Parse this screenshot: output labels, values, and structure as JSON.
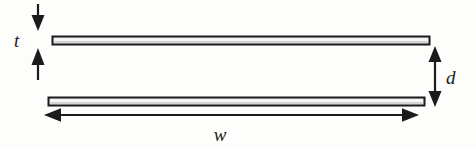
{
  "figure": {
    "kind": "parallel-plate-cross-section-diagram",
    "background_color": "#fdfdfc",
    "ink_color": "#1b1b1b",
    "plate_fill_color": "#e9e9e7",
    "plate_outline_color": "#1b1b1b",
    "width_px": 476,
    "height_px": 148
  },
  "labels": {
    "thickness": "t",
    "separation": "d",
    "width": "w"
  },
  "parts": {
    "top_plate": {
      "name": "top-plate",
      "x": 52,
      "y": 36,
      "width": 378,
      "height": 9
    },
    "bottom_plate": {
      "name": "bottom-plate",
      "x": 48,
      "y": 97,
      "width": 377,
      "height": 9
    }
  },
  "dimensions": {
    "thickness_arrow": {
      "name": "thickness-dimension",
      "label": "t",
      "label_x": 18,
      "label_y": 46,
      "top_arrow_x": 38,
      "top_arrow_y_start": 4,
      "top_arrow_y_end": 29,
      "bottom_arrow_x": 38,
      "bottom_arrow_y_start": 79,
      "bottom_arrow_y_end": 47
    },
    "separation_arrow": {
      "name": "separation-dimension",
      "label": "d",
      "label_x": 447,
      "label_y": 83,
      "arrow_x": 435,
      "arrow_y_top": 47,
      "arrow_y_bottom": 106
    },
    "width_arrow": {
      "name": "width-dimension",
      "label": "w",
      "label_x": 221,
      "label_y": 140,
      "arrow_y": 115,
      "arrow_x_left": 45,
      "arrow_x_right": 418
    }
  }
}
